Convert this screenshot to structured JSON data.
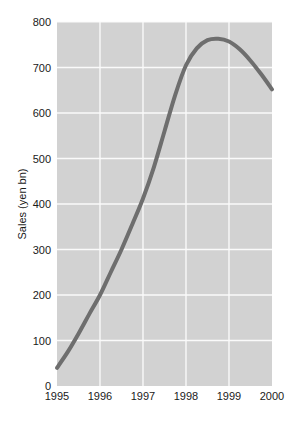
{
  "chart_data": {
    "type": "line",
    "title": "",
    "subtitle": "",
    "xlabel": "",
    "ylabel": "Sales (yen bn)",
    "xlim": [
      1995,
      2000
    ],
    "ylim": [
      0,
      800
    ],
    "grid": true,
    "legend": "none",
    "x_ticks": [
      "1995",
      "1996",
      "1997",
      "1998",
      "1999",
      "2000"
    ],
    "x_tick_values": [
      1995,
      1996,
      1997,
      1998,
      1999,
      2000
    ],
    "y_ticks": [
      "0",
      "100",
      "200",
      "300",
      "400",
      "500",
      "600",
      "700",
      "800"
    ],
    "y_tick_values": [
      0,
      100,
      200,
      300,
      400,
      500,
      600,
      700,
      800
    ],
    "series": [
      {
        "name": "Sales",
        "color": "#6e6e6e",
        "line_width": 4,
        "x": [
          1995.0,
          1995.25,
          1995.5,
          1995.75,
          1996.0,
          1996.25,
          1996.5,
          1996.75,
          1997.0,
          1997.25,
          1997.5,
          1997.75,
          1998.0,
          1998.25,
          1998.5,
          1998.75,
          1999.0,
          1999.25,
          1999.5,
          1999.75,
          2000.0
        ],
        "values": [
          40,
          75,
          115,
          158,
          200,
          250,
          300,
          355,
          412,
          480,
          560,
          640,
          705,
          742,
          760,
          763,
          757,
          740,
          715,
          685,
          652
        ]
      }
    ],
    "colors": {
      "plot_background": "#d2d2d2",
      "grid_line": "#fafafa",
      "line": "#6e6e6e",
      "text": "#1a1a1a",
      "page_background": "#ffffff"
    },
    "geometry": {
      "plot_left": 57,
      "plot_right": 272,
      "plot_top": 22,
      "plot_bottom": 386
    }
  }
}
